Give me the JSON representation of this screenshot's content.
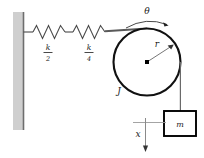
{
  "figure": {
    "background_color": "#ffffff"
  },
  "wall": {
    "name": "fixed-support-wall",
    "fill_color": "#cfcfcf",
    "edge_color": "#6e6e6e"
  },
  "springs": [
    {
      "label_numerator": "k",
      "label_denominator": "2",
      "label_text": "k/2",
      "coils": 4
    },
    {
      "label_numerator": "k",
      "label_denominator": "4",
      "label_text": "k/4",
      "coils": 4
    }
  ],
  "pulley": {
    "inertia_label": "J",
    "radius_label": "r",
    "angle_label": "θ",
    "outline_color": "#111111",
    "center_dot_color": "#000000"
  },
  "mass": {
    "label": "m",
    "displacement_label": "x",
    "border_color": "#000000",
    "fill_color": "#ffffff"
  },
  "colors": {
    "line": "#4a4a4a",
    "dark_line": "#111111",
    "text": "#1a1a1a"
  }
}
